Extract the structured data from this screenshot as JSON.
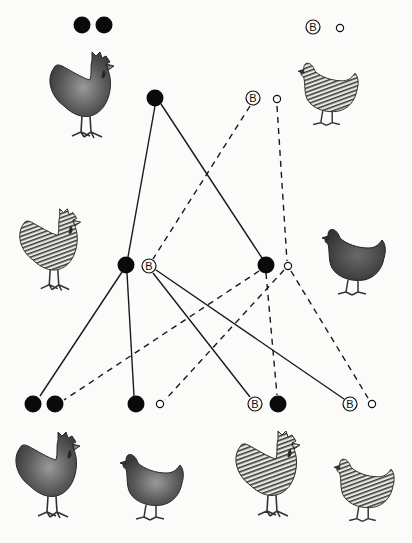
{
  "diagram": {
    "type": "inheritance-cross",
    "symbols": {
      "filled_circle": "non-barred sex chromosome (black)",
      "B_circle": "barring gene B on sex chromosome",
      "small_open_circle": "absent/second sex chromosome (hen)"
    },
    "label_B": "B",
    "colors": {
      "ink": "#111111",
      "paper": "#fbfbfa"
    },
    "parents": {
      "male": {
        "name": "non-barred-rooster",
        "genotype": [
          "filled",
          "filled"
        ],
        "gamete": "filled",
        "pattern": "solid-dark"
      },
      "female": {
        "name": "barred-hen",
        "genotype": [
          "B",
          "open"
        ],
        "gametes": [
          "B",
          "open"
        ],
        "pattern": "barred"
      }
    },
    "f1": [
      {
        "name": "barred-rooster",
        "genotype": [
          "filled",
          "B"
        ],
        "pattern": "barred"
      },
      {
        "name": "non-barred-hen",
        "genotype": [
          "filled",
          "open"
        ],
        "pattern": "solid-dark"
      }
    ],
    "f2": [
      {
        "name": "non-barred-rooster",
        "genotype": [
          "filled",
          "filled"
        ],
        "pattern": "solid-dark"
      },
      {
        "name": "non-barred-hen",
        "genotype": [
          "filled",
          "open"
        ],
        "pattern": "solid-dark"
      },
      {
        "name": "barred-rooster",
        "genotype": [
          "B",
          "filled"
        ],
        "pattern": "barred"
      },
      {
        "name": "barred-hen",
        "genotype": [
          "B",
          "open"
        ],
        "pattern": "barred"
      }
    ],
    "line_styles": {
      "from_male_gamete": "solid",
      "from_female_gamete": "dashed"
    }
  }
}
